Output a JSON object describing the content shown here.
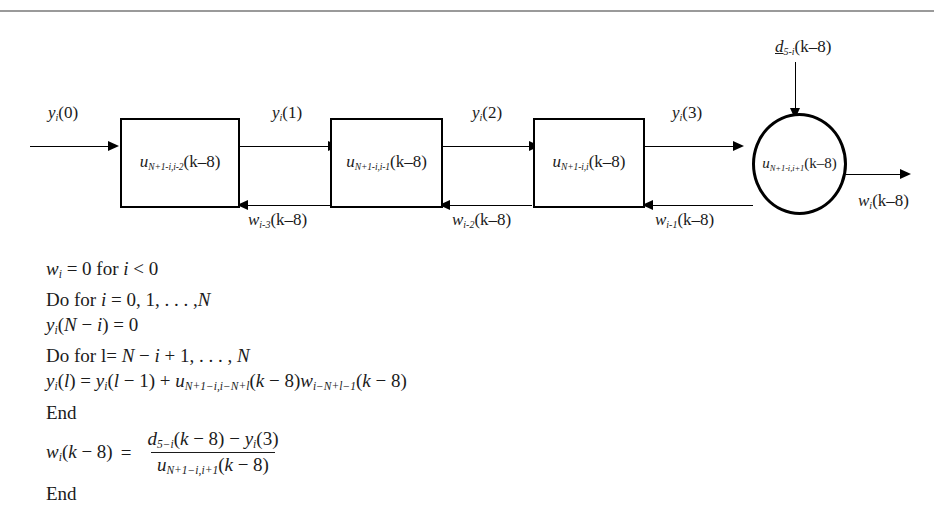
{
  "page": {
    "background": "#ffffff",
    "rule_color": "#9a9a9a",
    "ink_color": "#1a1a1a"
  },
  "figure": {
    "title": "Block diagram of recursive solver stage",
    "blocks": [
      {
        "id": "block-1",
        "label_base": "u",
        "label_sub": "N+1-i,i-2",
        "label_arg": "(k–8)"
      },
      {
        "id": "block-2",
        "label_base": "u",
        "label_sub": "N+1-i,i-1",
        "label_arg": "(k–8)"
      },
      {
        "id": "block-3",
        "label_base": "u",
        "label_sub": "N+1-i,i",
        "label_arg": "(k–8)"
      }
    ],
    "circle_node": {
      "id": "node-circle",
      "label_base": "u",
      "label_sub": "N+1-i,i+1",
      "label_arg": "(k–8)"
    },
    "forward_labels": [
      {
        "id": "y0",
        "base": "y",
        "sub": "i",
        "arg": "(0)"
      },
      {
        "id": "y1",
        "base": "y",
        "sub": "i",
        "arg": "(1)"
      },
      {
        "id": "y2",
        "base": "y",
        "sub": "i",
        "arg": "(2)"
      },
      {
        "id": "y3",
        "base": "y",
        "sub": "i",
        "arg": "(3)"
      }
    ],
    "feedback_labels": [
      {
        "id": "w-i-3",
        "base": "w",
        "sub": "i-3",
        "arg": "(k–8)"
      },
      {
        "id": "w-i-2",
        "base": "w",
        "sub": "i-2",
        "arg": "(k–8)"
      },
      {
        "id": "w-i-1",
        "base": "w",
        "sub": "i-1",
        "arg": "(k–8)"
      }
    ],
    "top_input_label": {
      "id": "d-5-i",
      "base": "d",
      "sub": "5-i",
      "arg": "(k–8)",
      "underlined": true
    },
    "output_label": {
      "id": "w-i-out",
      "base": "w",
      "sub": "i",
      "arg": "(k–8)"
    }
  },
  "algorithm": {
    "lines": [
      {
        "id": "line-1",
        "text": "wᵢ = 0 for i < 0"
      },
      {
        "id": "line-2",
        "text": "Do for i = 0, 1, … ,N"
      },
      {
        "id": "line-3",
        "text": "yᵢ(N − i) = 0"
      },
      {
        "id": "line-4",
        "text": "Do for l= N − i + 1, … , N"
      },
      {
        "id": "line-5",
        "text": "yᵢ(l) = yᵢ(l − 1) + uₙ₊₁₋ᵢ,ᵢ₋ₙ₊ₗ(k − 8)wᵢ₋ₙ₊ₗ₋₁(k − 8)"
      },
      {
        "id": "line-6",
        "text": "End"
      },
      {
        "id": "line-8",
        "text": "End"
      }
    ],
    "fraction_equation": {
      "id": "line-7",
      "lhs_base": "w",
      "lhs_sub": "i",
      "lhs_arg": "(k − 8)",
      "equals": "=",
      "numerator": {
        "base": "d",
        "sub": "5−i",
        "arg": "(k − 8)",
        "op": "−",
        "term2_base": "y",
        "term2_sub": "i",
        "term2_arg": "(3)"
      },
      "denominator": {
        "base": "u",
        "sub": "N+1−i,i+1",
        "arg": "(k − 8)"
      }
    }
  }
}
